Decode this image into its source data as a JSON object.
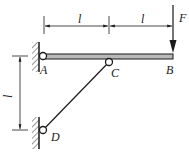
{
  "diagram": {
    "type": "statics-beam-with-strut",
    "points": {
      "A": {
        "label": "A"
      },
      "B": {
        "label": "B"
      },
      "C": {
        "label": "C"
      },
      "D": {
        "label": "D"
      }
    },
    "force": {
      "label": "F",
      "direction": "down"
    },
    "dimensions": {
      "top_left": "l",
      "top_right": "l",
      "left_vertical": "l"
    },
    "colors": {
      "line": "#1a1a1a",
      "beam_fill": "#b8b8b8",
      "background": "#ffffff"
    }
  }
}
